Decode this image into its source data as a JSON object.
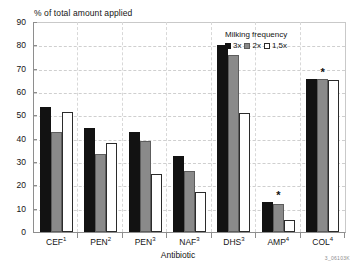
{
  "chart_data": {
    "type": "bar",
    "title": "",
    "ylabel": "% of total amount applied",
    "xlabel": "Antibiotic",
    "ylim": [
      0,
      90
    ],
    "ytick_step": 10,
    "yticks": [
      0,
      10,
      20,
      30,
      40,
      50,
      60,
      70,
      80,
      90
    ],
    "grid": true,
    "legend_position": "top-right",
    "legend_title": "Milking frequency",
    "categories": [
      "CEF",
      "PEN",
      "PEN",
      "NAF",
      "DHS",
      "AMP",
      "COL"
    ],
    "category_superscripts": [
      "1",
      "2",
      "3",
      "3",
      "3",
      "4",
      "4"
    ],
    "category_labels": [
      "CEF1",
      "PEN2",
      "PEN3",
      "NAF3",
      "DHS3",
      "AMP4",
      "COL4"
    ],
    "series": [
      {
        "name": "3x",
        "values": [
          53.5,
          44.5,
          43.0,
          32.5,
          80.0,
          13.0,
          65.5
        ]
      },
      {
        "name": "2x",
        "values": [
          43.0,
          33.5,
          39.0,
          26.0,
          76.0,
          12.0,
          65.5
        ]
      },
      {
        "name": "1,5x",
        "values": [
          51.5,
          38.0,
          25.0,
          17.0,
          51.0,
          5.0,
          65.0
        ]
      }
    ],
    "annotations": [
      {
        "category": "AMP4",
        "marker": "*"
      },
      {
        "category": "COL4",
        "marker": "*"
      }
    ],
    "colors": {
      "3x": "#121212",
      "2x": "#8a8a8a",
      "1,5x": "#ffffff",
      "axis": "#8e8e8e",
      "grid": "#cfcfcf"
    }
  },
  "figure_code": "3_06103K"
}
